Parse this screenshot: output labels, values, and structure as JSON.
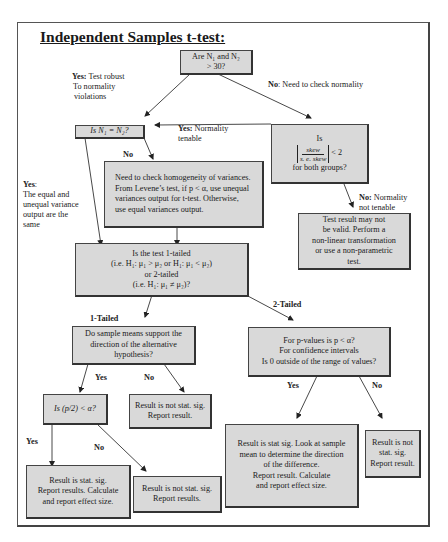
{
  "title": "Independent Samples t-test:",
  "colors": {
    "box_fill": "#d9d9d9",
    "box_border": "#444444",
    "frame_border": "#555555",
    "text": "#1a1a1a"
  },
  "nodes": {
    "n_size": {
      "line1": "Are  N₁ and N₂",
      "line2": "> 30?"
    },
    "equal_n": {
      "text": "Is N₁ = N₂?"
    },
    "skew": {
      "line1": "Is",
      "numerator": "skew",
      "denominator": "s. e. skew",
      "comparison": "< 2",
      "line3": "for both groups?"
    },
    "levene": {
      "line1": "Need to check homogeneity of variances.",
      "line2": "From Levene’s test, if p < α, use unequal",
      "line3": "variances output for t-test. Otherwise,",
      "line4": "use equal variances output."
    },
    "not_valid": {
      "line1": "Test result may not",
      "line2": "be valid. Perform a",
      "line3": "non-linear transformation",
      "line4": "or use a non-parametric",
      "line5": "test."
    },
    "tailed": {
      "line1": "Is the test 1-tailed",
      "line2": "(i.e. H₁: μ₁ > μ₂ or H₁: μ₁ < μ₂)",
      "line3": "or 2-tailed",
      "line4": "(i.e. H₁: μ₁ ≠ μ₂)?"
    },
    "direction": {
      "line1": "Do sample means support the",
      "line2": "direction of the alternative",
      "line3": "hypothesis?"
    },
    "two_tailed_q": {
      "line1": "For p-values is  p <  α?",
      "line2": "For confidence intervals",
      "line3": "Is 0 outside of the range of values?"
    },
    "half_p": {
      "text": "Is (p/2) < α?"
    },
    "not_sig_1": {
      "line1": "Result is not stat. sig.",
      "line2": "Report result."
    },
    "sig_1": {
      "line1": "Result is stat. sig.",
      "line2": "Report results. Calculate",
      "line3": "and report effect size."
    },
    "not_sig_2": {
      "line1": "Result is not stat. sig.",
      "line2": "Report results."
    },
    "sig_2": {
      "line1": "Result is stat sig. Look at sample",
      "line2": "mean to determine the direction",
      "line3": "of the difference.",
      "line4": "Report result. Calculate",
      "line5": "and report effect size."
    },
    "not_sig_3": {
      "line1": "Result is not",
      "line2": "stat. sig.",
      "line3": "Report result."
    }
  },
  "labels": {
    "yes_robust": {
      "bold": "Yes:",
      "text1": " Test robust",
      "text2": "To normality",
      "text3": "violations"
    },
    "no_check_normality": {
      "bold": "No",
      "text": ": Need to check normality"
    },
    "yes_normality": {
      "bold": "Yes:",
      "text1": "  Normality",
      "text2": "tenable"
    },
    "no_equal_n": {
      "bold": "No"
    },
    "yes_equal_n": {
      "bold": "Yes",
      "text1": ":",
      "text2": "The equal and",
      "text3": "unequal variance",
      "text4": "output are the",
      "text5": "same"
    },
    "no_normality": {
      "bold": "No:",
      "text1": " Normality",
      "text2": "not tenable"
    },
    "one_tailed": {
      "bold": "1-Tailed"
    },
    "two_tailed": {
      "bold": "2-Tailed"
    },
    "yes_direction": {
      "bold": "Yes"
    },
    "no_direction": {
      "bold": "No"
    },
    "yes_half_p": {
      "bold": "Yes"
    },
    "no_half_p": {
      "bold": "No"
    },
    "yes_two_tailed": {
      "bold": "Yes"
    },
    "no_two_tailed": {
      "bold": "No"
    }
  }
}
